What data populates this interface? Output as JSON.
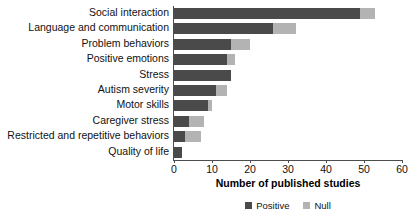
{
  "chart_data": {
    "type": "bar",
    "orientation": "horizontal",
    "stacked": true,
    "title": "",
    "xlabel": "Number of published studies",
    "ylabel": "",
    "xlim": [
      0,
      60
    ],
    "xticks": [
      0,
      10,
      20,
      30,
      40,
      50,
      60
    ],
    "grid": false,
    "legend_position": "bottom-center",
    "categories": [
      "Social interaction",
      "Language and communication",
      "Problem behaviors",
      "Positive emotions",
      "Stress",
      "Autism severity",
      "Motor skills",
      "Caregiver stress",
      "Restricted and repetitive behaviors",
      "Quality of life"
    ],
    "series": [
      {
        "name": "Positive",
        "color": "#4a4a4a",
        "values": [
          49,
          26,
          15,
          14,
          15,
          11,
          9,
          4,
          3,
          2
        ]
      },
      {
        "name": "Null",
        "color": "#b3b3b3",
        "values": [
          4,
          6,
          5,
          2,
          0,
          3,
          1,
          4,
          4,
          0
        ]
      }
    ],
    "totals": [
      53,
      32,
      20,
      16,
      15,
      14,
      10,
      8,
      7,
      2
    ]
  },
  "legend": {
    "items": [
      {
        "label": "Positive",
        "color": "#4a4a4a",
        "swatch": "square-swatch"
      },
      {
        "label": "Null",
        "color": "#b3b3b3",
        "swatch": "square-swatch"
      }
    ]
  },
  "axis": {
    "x_title": "Number of published studies",
    "tick_labels": [
      "0",
      "10",
      "20",
      "30",
      "40",
      "50",
      "60"
    ]
  },
  "colors": {
    "positive": "#4a4a4a",
    "null": "#b3b3b3",
    "axis": "#4d4d4d",
    "text": "#111111",
    "background": "#ffffff"
  }
}
